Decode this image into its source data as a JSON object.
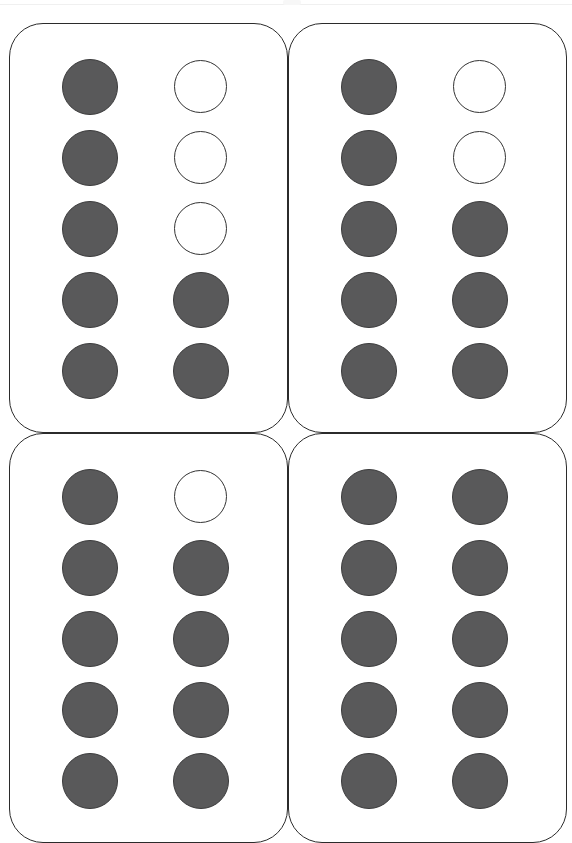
{
  "page": {
    "background_color": "#ffffff",
    "width": 572,
    "height": 841,
    "top_rule_color": "#f0f0f0"
  },
  "appearance": {
    "card_border_color": "#2b2b2b",
    "filled_dot_color": "#59595a",
    "filled_dot_border_color": "#3b3b3c",
    "empty_dot_fill_color": "#ffffff",
    "empty_dot_border_color": "#333333"
  },
  "worksheet": {
    "rows_per_frame": 5,
    "columns_per_frame": 2,
    "cards": [
      {
        "position": "top-left",
        "filled_count": 7,
        "empty_count": 3,
        "cells": [
          [
            "filled",
            "empty"
          ],
          [
            "filled",
            "empty"
          ],
          [
            "filled",
            "empty"
          ],
          [
            "filled",
            "filled"
          ],
          [
            "filled",
            "filled"
          ]
        ]
      },
      {
        "position": "top-right",
        "filled_count": 8,
        "empty_count": 2,
        "cells": [
          [
            "filled",
            "empty"
          ],
          [
            "filled",
            "empty"
          ],
          [
            "filled",
            "filled"
          ],
          [
            "filled",
            "filled"
          ],
          [
            "filled",
            "filled"
          ]
        ]
      },
      {
        "position": "bottom-left",
        "filled_count": 9,
        "empty_count": 1,
        "cells": [
          [
            "filled",
            "empty"
          ],
          [
            "filled",
            "filled"
          ],
          [
            "filled",
            "filled"
          ],
          [
            "filled",
            "filled"
          ],
          [
            "filled",
            "filled"
          ]
        ]
      },
      {
        "position": "bottom-right",
        "filled_count": 10,
        "empty_count": 0,
        "cells": [
          [
            "filled",
            "filled"
          ],
          [
            "filled",
            "filled"
          ],
          [
            "filled",
            "filled"
          ],
          [
            "filled",
            "filled"
          ],
          [
            "filled",
            "filled"
          ]
        ]
      }
    ]
  }
}
